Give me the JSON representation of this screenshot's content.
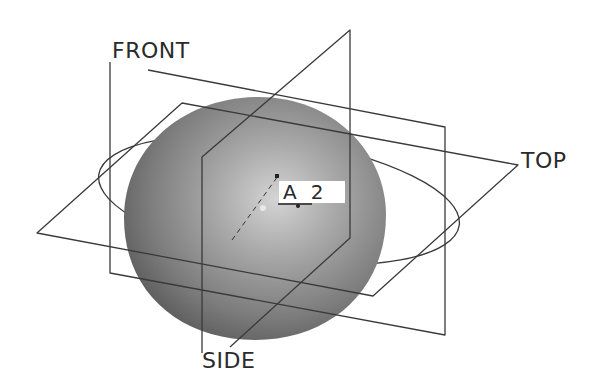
{
  "diagram": {
    "type": "3D datum planes around a sphere (CAD view)",
    "background": "#ffffff",
    "line_color": "#3a3a3a",
    "sphere_color_light": "#c8c8c8",
    "sphere_color_dark": "#5e5e5e",
    "labels": {
      "front": "FRONT",
      "top": "TOP",
      "side": "SIDE"
    },
    "axis_tag": {
      "letter": "A",
      "number": "2",
      "text": "A_2"
    },
    "planes": [
      {
        "name": "FRONT",
        "points": [
          [
            110,
            62
          ],
          [
            110,
            273
          ],
          [
            445,
            335
          ],
          [
            445,
            127
          ],
          [
            148,
            70
          ]
        ]
      },
      {
        "name": "TOP",
        "points": [
          [
            37,
            233
          ],
          [
            182,
            103
          ],
          [
            518,
            165
          ],
          [
            373,
            296
          ]
        ]
      },
      {
        "name": "SIDE",
        "points": [
          [
            202,
            353
          ],
          [
            202,
            157
          ],
          [
            350,
            30
          ],
          [
            350,
            238
          ],
          [
            230,
            347
          ]
        ]
      }
    ],
    "ellipse": {
      "cx": 279,
      "cy": 200,
      "rx": 182,
      "ry": 60,
      "rotate": 8
    },
    "sphere": {
      "cx": 255,
      "cy": 218,
      "rx": 131,
      "ry": 122
    }
  }
}
